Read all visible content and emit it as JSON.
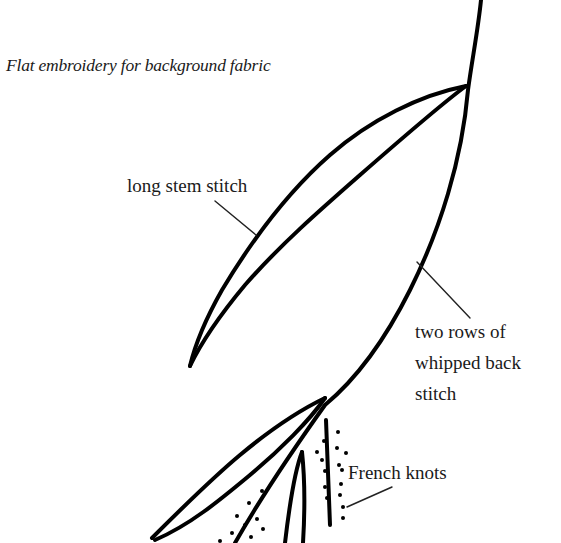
{
  "title": "Flat embroidery for background fabric",
  "labels": {
    "stem_stitch": "long stem stitch",
    "whipped_back_stitch": {
      "line1": "two rows of",
      "line2": "whipped back",
      "line3": "stitch"
    },
    "french_knots": "French knots"
  },
  "colors": {
    "ink": "#000000",
    "text": "#1a1a1a",
    "background": "#ffffff"
  }
}
